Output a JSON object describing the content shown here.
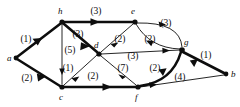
{
  "figure": {
    "background_color": "#ffffff",
    "ink_color": "#0d0d0d"
  },
  "nodes": [
    {
      "id": "a",
      "label": "a",
      "x": 16,
      "y": 58,
      "label_x": 7,
      "label_y": 61
    },
    {
      "id": "h",
      "label": "h",
      "x": 62,
      "y": 22,
      "label_x": 58,
      "label_y": 14
    },
    {
      "id": "c",
      "label": "c",
      "x": 62,
      "y": 87,
      "label_x": 59,
      "label_y": 100
    },
    {
      "id": "d",
      "label": "d",
      "x": 99,
      "y": 54,
      "label_x": 94,
      "label_y": 48
    },
    {
      "id": "e",
      "label": "e",
      "x": 135,
      "y": 22,
      "label_x": 131,
      "label_y": 14
    },
    {
      "id": "f",
      "label": "f",
      "x": 138,
      "y": 87,
      "label_x": 135,
      "label_y": 100
    },
    {
      "id": "g",
      "label": "g",
      "x": 182,
      "y": 50,
      "label_x": 184,
      "label_y": 45
    },
    {
      "id": "b",
      "label": "b",
      "x": 226,
      "y": 74,
      "label_x": 231,
      "label_y": 77
    }
  ],
  "edges": [
    {
      "from": "a",
      "to": "h",
      "weight": "(1)",
      "style": "bold",
      "shape": "straight",
      "label_x": 26,
      "label_y": 42
    },
    {
      "from": "a",
      "to": "c",
      "weight": "(2)",
      "style": "bold",
      "shape": "straight",
      "label_x": 27,
      "label_y": 81
    },
    {
      "from": "h",
      "to": "e",
      "weight": "(3)",
      "style": "bold",
      "shape": "straight",
      "label_x": 96,
      "label_y": 14
    },
    {
      "from": "h",
      "to": "d",
      "weight": "(3)",
      "style": "bold",
      "shape": "straight",
      "label_x": 78,
      "label_y": 37
    },
    {
      "from": "h",
      "to": "c",
      "weight": "(5)",
      "style": "thin",
      "shape": "straight",
      "label_x": 64,
      "label_y": 53
    },
    {
      "from": "d",
      "to": "c",
      "weight": "(1)",
      "style": "thin",
      "shape": "straight",
      "label_x": 62,
      "label_y": 71
    },
    {
      "from": "c",
      "to": "f",
      "weight": "(2)",
      "style": "bold",
      "shape": "straight",
      "label_x": 93,
      "label_y": 79
    },
    {
      "from": "e",
      "to": "d",
      "weight": "(2)",
      "style": "thin",
      "shape": "straight",
      "label_x": 118,
      "label_y": 41
    },
    {
      "from": "d",
      "to": "g",
      "weight": "(3)",
      "style": "thin",
      "shape": "straight",
      "label_x": 133,
      "label_y": 59
    },
    {
      "from": "d",
      "to": "f",
      "weight": "(7)",
      "style": "thin",
      "shape": "straight",
      "label_x": 123,
      "label_y": 71
    },
    {
      "from": "e",
      "to": "g",
      "weight": "(3)",
      "style": "thin",
      "shape": "curve-out",
      "label_x": 163,
      "label_y": 26
    },
    {
      "from": "g",
      "to": "e",
      "weight": "(2)",
      "style": "thin",
      "shape": "curve-in",
      "label_x": 148,
      "label_y": 42
    },
    {
      "from": "f",
      "to": "g",
      "weight": "(2)",
      "style": "bold",
      "shape": "curve",
      "label_x": 155,
      "label_y": 71
    },
    {
      "from": "g",
      "to": "b",
      "weight": "(1)",
      "style": "bold",
      "shape": "straight",
      "label_x": 204,
      "label_y": 58
    },
    {
      "from": "f",
      "to": "b",
      "weight": "(4)",
      "style": "thin",
      "shape": "straight",
      "label_x": 180,
      "label_y": 80
    }
  ]
}
